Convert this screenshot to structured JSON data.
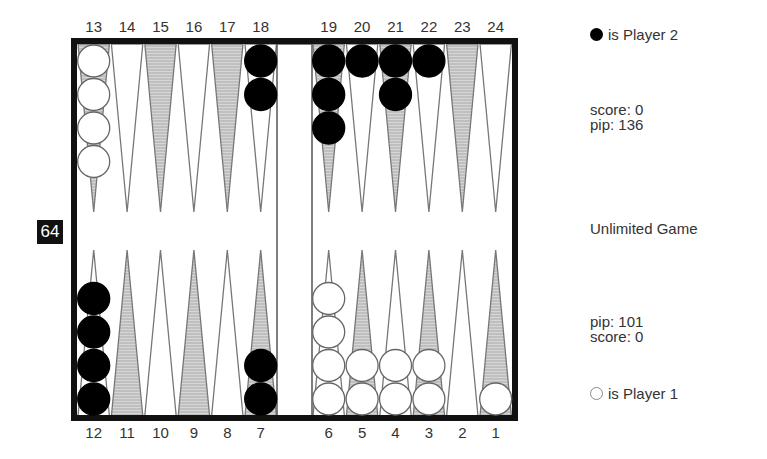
{
  "board": {
    "top_point_labels": [
      "13",
      "14",
      "15",
      "16",
      "17",
      "18",
      "19",
      "20",
      "21",
      "22",
      "23",
      "24"
    ],
    "bottom_point_labels": [
      "12",
      "11",
      "10",
      "9",
      "8",
      "7",
      "6",
      "5",
      "4",
      "3",
      "2",
      "1"
    ],
    "shaded_points": [
      1,
      3,
      5,
      7,
      9,
      11,
      13,
      15,
      17,
      19,
      21,
      23
    ],
    "colors": {
      "border": "#111111",
      "shaded_point": "#c8c8c8",
      "point_outline": "#777777",
      "checker_black": "#000000",
      "checker_white": "#ffffff"
    },
    "checkers": [
      {
        "point": 13,
        "player": 1,
        "count": 4
      },
      {
        "point": 18,
        "player": 2,
        "count": 2
      },
      {
        "point": 19,
        "player": 2,
        "count": 3
      },
      {
        "point": 20,
        "player": 2,
        "count": 1
      },
      {
        "point": 21,
        "player": 2,
        "count": 2
      },
      {
        "point": 22,
        "player": 2,
        "count": 1
      },
      {
        "point": 12,
        "player": 2,
        "count": 4
      },
      {
        "point": 7,
        "player": 2,
        "count": 2
      },
      {
        "point": 6,
        "player": 1,
        "count": 4
      },
      {
        "point": 5,
        "player": 1,
        "count": 2
      },
      {
        "point": 4,
        "player": 1,
        "count": 2
      },
      {
        "point": 3,
        "player": 1,
        "count": 2
      },
      {
        "point": 1,
        "player": 1,
        "count": 1
      }
    ]
  },
  "doubling_cube": {
    "value": "64"
  },
  "player2": {
    "legend": "is Player 2",
    "score": "score: 0",
    "pip": "pip: 136"
  },
  "game_type": "Unlimited Game",
  "player1": {
    "legend": "is Player 1",
    "score": "score: 0",
    "pip": "pip: 101"
  }
}
